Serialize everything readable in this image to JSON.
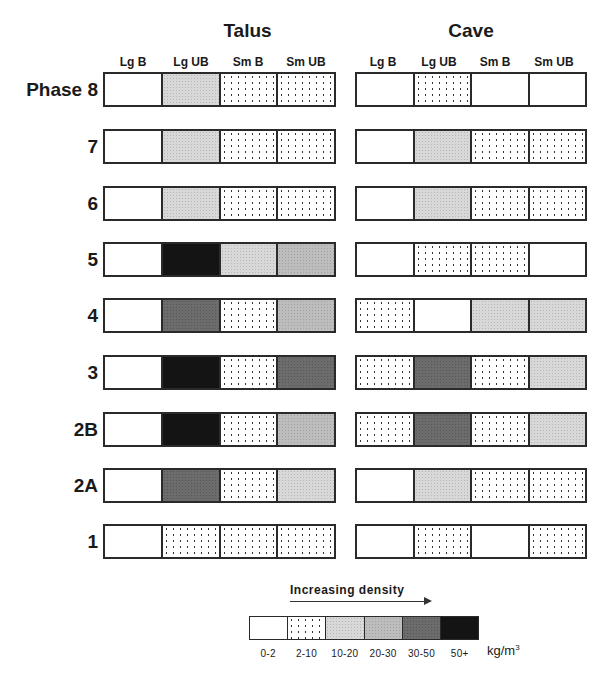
{
  "chart_data": {
    "type": "heatmap",
    "title": "",
    "panels": [
      {
        "name": "Talus",
        "columns": [
          "Lg B",
          "Lg UB",
          "Sm B",
          "Sm UB"
        ],
        "rows": [
          {
            "phase": "Phase 8",
            "values": [
              "0-2",
              "10-20",
              "2-10",
              "2-10"
            ]
          },
          {
            "phase": "7",
            "values": [
              "0-2",
              "10-20",
              "2-10",
              "2-10"
            ]
          },
          {
            "phase": "6",
            "values": [
              "0-2",
              "10-20",
              "2-10",
              "2-10"
            ]
          },
          {
            "phase": "5",
            "values": [
              "0-2",
              "50+",
              "10-20",
              "20-30"
            ]
          },
          {
            "phase": "4",
            "values": [
              "0-2",
              "30-50",
              "2-10",
              "20-30"
            ]
          },
          {
            "phase": "3",
            "values": [
              "0-2",
              "50+",
              "2-10",
              "30-50"
            ]
          },
          {
            "phase": "2B",
            "values": [
              "0-2",
              "50+",
              "2-10",
              "20-30"
            ]
          },
          {
            "phase": "2A",
            "values": [
              "0-2",
              "30-50",
              "2-10",
              "10-20"
            ]
          },
          {
            "phase": "1",
            "values": [
              "0-2",
              "2-10",
              "2-10",
              "2-10"
            ]
          }
        ]
      },
      {
        "name": "Cave",
        "columns": [
          "Lg B",
          "Lg UB",
          "Sm B",
          "Sm UB"
        ],
        "rows": [
          {
            "phase": "Phase 8",
            "values": [
              "0-2",
              "2-10",
              "0-2",
              "0-2"
            ]
          },
          {
            "phase": "7",
            "values": [
              "0-2",
              "10-20",
              "2-10",
              "2-10"
            ]
          },
          {
            "phase": "6",
            "values": [
              "0-2",
              "10-20",
              "2-10",
              "2-10"
            ]
          },
          {
            "phase": "5",
            "values": [
              "0-2",
              "2-10",
              "2-10",
              "0-2"
            ]
          },
          {
            "phase": "4",
            "values": [
              "2-10",
              "0-2",
              "10-20",
              "10-20"
            ]
          },
          {
            "phase": "3",
            "values": [
              "2-10",
              "30-50",
              "2-10",
              "10-20"
            ]
          },
          {
            "phase": "2B",
            "values": [
              "2-10",
              "30-50",
              "2-10",
              "10-20"
            ]
          },
          {
            "phase": "2A",
            "values": [
              "0-2",
              "10-20",
              "2-10",
              "2-10"
            ]
          },
          {
            "phase": "1",
            "values": [
              "0-2",
              "2-10",
              "0-2",
              "2-10"
            ]
          }
        ]
      }
    ],
    "legend": {
      "title": "Increasing density",
      "categories": [
        "0-2",
        "2-10",
        "10-20",
        "20-30",
        "30-50",
        "50+"
      ],
      "unit": "kg/m",
      "unit_exp": "3"
    },
    "levels": {
      "Talus": [
        [
          0,
          2,
          1,
          1
        ],
        [
          0,
          2,
          1,
          1
        ],
        [
          0,
          2,
          1,
          1
        ],
        [
          0,
          5,
          2,
          3
        ],
        [
          0,
          4,
          1,
          3
        ],
        [
          0,
          5,
          1,
          4
        ],
        [
          0,
          5,
          1,
          3
        ],
        [
          0,
          4,
          1,
          2
        ],
        [
          0,
          1,
          1,
          1
        ]
      ],
      "Cave": [
        [
          0,
          1,
          0,
          0
        ],
        [
          0,
          2,
          1,
          1
        ],
        [
          0,
          2,
          1,
          1
        ],
        [
          0,
          1,
          1,
          0
        ],
        [
          1,
          0,
          2,
          2
        ],
        [
          1,
          4,
          1,
          2
        ],
        [
          1,
          4,
          1,
          2
        ],
        [
          0,
          2,
          1,
          1
        ],
        [
          0,
          1,
          0,
          1
        ]
      ]
    }
  }
}
